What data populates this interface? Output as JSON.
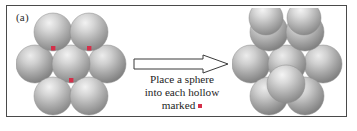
{
  "figure": {
    "panel_label": "(a)",
    "border_color": "#4a4a4a",
    "background": "#ffffff"
  },
  "caption": {
    "line1": "Place a sphere",
    "line2": "into each hollow",
    "line3": "marked",
    "marker_color": "#d4304a",
    "marker_shape": "square-dot"
  },
  "arrow": {
    "direction": "right",
    "style": "hollow-block-arrow",
    "outline_color": "#3a3a3a",
    "fill_color": "#ffffff"
  },
  "left_cluster": {
    "name": "close-packed-layer-with-marked-hollows",
    "sphere_color": "#9c9c9c",
    "sphere_highlight": "#e3e3e3",
    "sphere_count": 7,
    "marked_hollow_count": 3,
    "marker_color": "#d4304a",
    "rows": [
      {
        "label": "top-row",
        "count": 2
      },
      {
        "label": "middle-row",
        "count": 3
      },
      {
        "label": "bottom-row",
        "count": 2
      }
    ]
  },
  "right_cluster": {
    "name": "close-packed-layer-with-spheres-added",
    "sphere_color": "#9c9c9c",
    "sphere_highlight": "#e3e3e3",
    "base_sphere_count": 7,
    "added_sphere_count": 3,
    "total_sphere_count": 10
  }
}
